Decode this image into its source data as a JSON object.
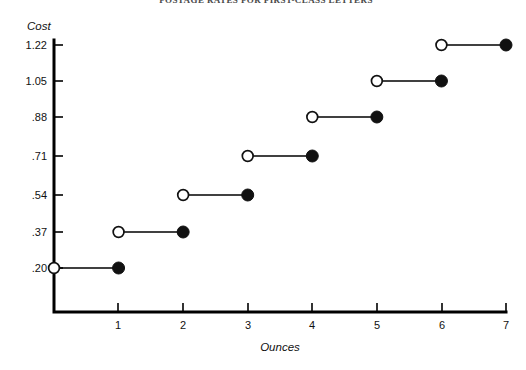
{
  "chart_data": {
    "type": "line",
    "title": "",
    "xlabel": "Ounces",
    "ylabel": "Cost",
    "xlim": [
      0,
      7
    ],
    "ylim": [
      0.2,
      1.22
    ],
    "grid": false,
    "legend": null,
    "x_ticks": [
      "1",
      "2",
      "3",
      "4",
      "5",
      "6",
      "7"
    ],
    "x_tick_values": [
      1,
      2,
      3,
      4,
      5,
      6,
      7
    ],
    "y_ticks": [
      ".20",
      ".37",
      ".54",
      ".71",
      ".88",
      "1.05",
      "1.22"
    ],
    "y_tick_values": [
      0.2,
      0.37,
      0.54,
      0.71,
      0.88,
      1.05,
      1.22
    ],
    "step_segments": [
      {
        "x_start": 0,
        "x_end": 1,
        "y": 0.2,
        "start_marker": "open",
        "end_marker": "filled"
      },
      {
        "x_start": 1,
        "x_end": 2,
        "y": 0.37,
        "start_marker": "open",
        "end_marker": "filled"
      },
      {
        "x_start": 2,
        "x_end": 3,
        "y": 0.54,
        "start_marker": "open",
        "end_marker": "filled"
      },
      {
        "x_start": 3,
        "x_end": 4,
        "y": 0.71,
        "start_marker": "open",
        "end_marker": "filled"
      },
      {
        "x_start": 4,
        "x_end": 5,
        "y": 0.88,
        "start_marker": "open",
        "end_marker": "filled"
      },
      {
        "x_start": 5,
        "x_end": 6,
        "y": 1.05,
        "start_marker": "open",
        "end_marker": "filled"
      },
      {
        "x_start": 6,
        "x_end": 7,
        "y": 1.22,
        "start_marker": "open",
        "end_marker": "filled"
      }
    ],
    "colors": {
      "axis": "#000000",
      "line": "#111111",
      "marker_filled": "#111111",
      "marker_open_fill": "#ffffff",
      "text": "#111111"
    }
  },
  "labels": {
    "y_axis_title": "Cost",
    "x_axis_title": "Ounces",
    "y": {
      "t0": ".20",
      "t1": ".37",
      "t2": ".54",
      "t3": ".71",
      "t4": ".88",
      "t5": "1.05",
      "t6": "1.22"
    },
    "x": {
      "t1": "1",
      "t2": "2",
      "t3": "3",
      "t4": "4",
      "t5": "5",
      "t6": "6",
      "t7": "7"
    }
  },
  "title_strip": {
    "text": "POSTAGE RATES FOR FIRST-CLASS LETTERS"
  }
}
